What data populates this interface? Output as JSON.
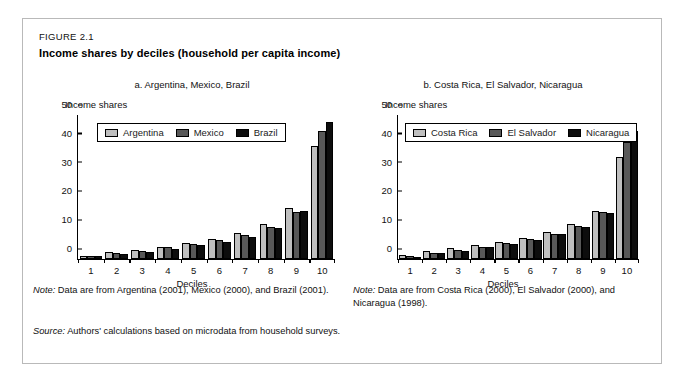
{
  "figure": {
    "number": "FIGURE 2.1",
    "title": "Income shares by deciles (household per capita income)",
    "source_label": "Source:",
    "source_text": "Authors' calculations based on microdata from household surveys.",
    "note_label": "Note:"
  },
  "panels": [
    {
      "title": "a. Argentina, Mexico, Brazil",
      "note": "Data are from Argentina (2001), Mexico (2000), and Brazil (2001)."
    },
    {
      "title": "b. Costa Rica, El Salvador, Nicaragua",
      "note": "Data are from Costa Rica (2000), El Salvador (2000), and Nicaragua (1998)."
    }
  ],
  "chart_data": [
    {
      "type": "bar",
      "title": "a. Argentina, Mexico, Brazil",
      "xlabel": "Deciles",
      "ylabel": "Income shares",
      "categories": [
        "1",
        "2",
        "3",
        "4",
        "5",
        "6",
        "7",
        "8",
        "9",
        "10"
      ],
      "yticks": [
        0,
        10,
        20,
        30,
        40,
        50
      ],
      "ylim": [
        0,
        50
      ],
      "grid": false,
      "legend_position": "top-left",
      "series": [
        {
          "name": "Argentina",
          "color": "#bfbfbf",
          "values": [
            1.2,
            2.3,
            3.1,
            4.2,
            5.5,
            7.1,
            9.2,
            12.3,
            17.8,
            39.2
          ]
        },
        {
          "name": "Mexico",
          "color": "#585858",
          "values": [
            1.1,
            2.0,
            2.9,
            4.0,
            5.1,
            6.6,
            8.3,
            11.0,
            16.3,
            44.3
          ]
        },
        {
          "name": "Brazil",
          "color": "#0d0d0d",
          "values": [
            0.9,
            1.8,
            2.5,
            3.5,
            4.7,
            6.0,
            7.8,
            10.8,
            16.6,
            47.5
          ]
        }
      ]
    },
    {
      "type": "bar",
      "title": "b. Costa Rica, El Salvador, Nicaragua",
      "xlabel": "Deciles",
      "ylabel": "Income shares",
      "categories": [
        "1",
        "2",
        "3",
        "4",
        "5",
        "6",
        "7",
        "8",
        "9",
        "10"
      ],
      "yticks": [
        0,
        10,
        20,
        30,
        40,
        50
      ],
      "ylim": [
        0,
        50
      ],
      "grid": false,
      "legend_position": "top-left",
      "series": [
        {
          "name": "Costa Rica",
          "color": "#bfbfbf",
          "values": [
            1.3,
            2.8,
            3.9,
            5.0,
            6.0,
            7.4,
            9.3,
            12.0,
            16.6,
            35.5
          ]
        },
        {
          "name": "El Salvador",
          "color": "#585858",
          "values": [
            0.9,
            2.1,
            3.1,
            4.3,
            5.4,
            6.9,
            8.8,
            11.4,
            16.3,
            40.7
          ]
        },
        {
          "name": "Nicaragua",
          "color": "#0d0d0d",
          "values": [
            0.8,
            2.0,
            2.9,
            4.1,
            5.1,
            6.5,
            8.6,
            11.1,
            15.9,
            44.3
          ]
        }
      ]
    }
  ]
}
